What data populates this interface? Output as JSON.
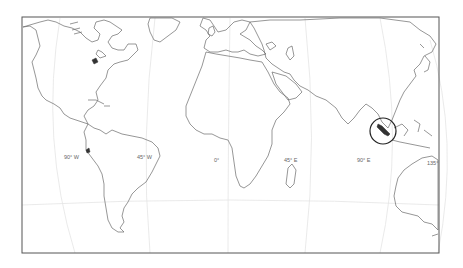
{
  "map": {
    "projection": "world map, curved meridians (Robinson-like)",
    "frame": {
      "x": 22,
      "y": 17,
      "width": 417,
      "height": 236
    },
    "longitude_labels": [
      {
        "text": "90° W",
        "x": 64,
        "y": 157
      },
      {
        "text": "45° W",
        "x": 137,
        "y": 157
      },
      {
        "text": "0°",
        "x": 214,
        "y": 160
      },
      {
        "text": "45° E",
        "x": 284,
        "y": 160
      },
      {
        "text": "90° E",
        "x": 357,
        "y": 160
      },
      {
        "text": "135°",
        "x": 427,
        "y": 163
      }
    ],
    "highlight": {
      "shape": "circle",
      "region": "Sumatra",
      "cx": 383,
      "cy": 131,
      "r": 13,
      "color": "#222222"
    },
    "colors": {
      "coastline": "#6a6a6a",
      "graticule": "#e4e4e4",
      "frame": "#555555",
      "background": "#ffffff"
    }
  }
}
